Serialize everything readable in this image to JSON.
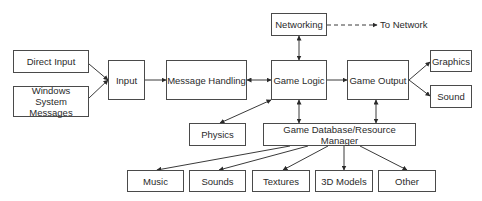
{
  "diagram": {
    "type": "flowchart",
    "nodes": [
      {
        "id": "direct_input",
        "label": "Direct Input",
        "x": 13,
        "y": 50,
        "w": 76,
        "h": 23
      },
      {
        "id": "windows_msgs",
        "label": "Windows System Messages",
        "x": 13,
        "y": 86,
        "w": 76,
        "h": 31
      },
      {
        "id": "input",
        "label": "Input",
        "x": 108,
        "y": 60,
        "w": 37,
        "h": 40
      },
      {
        "id": "message_handling",
        "label": "Message Handling",
        "x": 166,
        "y": 60,
        "w": 81,
        "h": 40
      },
      {
        "id": "networking",
        "label": "Networking",
        "x": 271,
        "y": 13,
        "w": 56,
        "h": 23
      },
      {
        "id": "game_logic",
        "label": "Game Logic",
        "x": 271,
        "y": 60,
        "w": 56,
        "h": 40
      },
      {
        "id": "game_output",
        "label": "Game Output",
        "x": 347,
        "y": 60,
        "w": 62,
        "h": 40
      },
      {
        "id": "graphics",
        "label": "Graphics",
        "x": 430,
        "y": 50,
        "w": 42,
        "h": 22
      },
      {
        "id": "sound",
        "label": "Sound",
        "x": 430,
        "y": 85,
        "w": 42,
        "h": 23
      },
      {
        "id": "physics",
        "label": "Physics",
        "x": 189,
        "y": 123,
        "w": 57,
        "h": 23
      },
      {
        "id": "game_db",
        "label": "Game Database/Resource Manager",
        "x": 263,
        "y": 123,
        "w": 153,
        "h": 23
      },
      {
        "id": "music",
        "label": "Music",
        "x": 127,
        "y": 170,
        "w": 57,
        "h": 22
      },
      {
        "id": "sounds",
        "label": "Sounds",
        "x": 189,
        "y": 170,
        "w": 57,
        "h": 22
      },
      {
        "id": "textures",
        "label": "Textures",
        "x": 252,
        "y": 170,
        "w": 58,
        "h": 22
      },
      {
        "id": "models_3d",
        "label": "3D Models",
        "x": 315,
        "y": 170,
        "w": 58,
        "h": 22
      },
      {
        "id": "other",
        "label": "Other",
        "x": 378,
        "y": 170,
        "w": 58,
        "h": 22
      }
    ],
    "external_label": {
      "text": "To Network",
      "x": 380,
      "y": 19
    },
    "edges": [
      {
        "from": "direct_input",
        "to": "input",
        "x1": 89,
        "y1": 64,
        "x2": 108,
        "y2": 80,
        "start": false,
        "end": true,
        "dashed": false
      },
      {
        "from": "windows_msgs",
        "to": "input",
        "x1": 89,
        "y1": 98,
        "x2": 108,
        "y2": 80,
        "start": false,
        "end": true,
        "dashed": false
      },
      {
        "from": "input",
        "to": "message_handling",
        "x1": 145,
        "y1": 80,
        "x2": 166,
        "y2": 80,
        "start": false,
        "end": true,
        "dashed": false
      },
      {
        "from": "message_handling",
        "to": "game_logic",
        "x1": 247,
        "y1": 80,
        "x2": 271,
        "y2": 80,
        "start": true,
        "end": true,
        "dashed": false
      },
      {
        "from": "networking",
        "to": "game_logic",
        "x1": 299,
        "y1": 36,
        "x2": 299,
        "y2": 60,
        "start": true,
        "end": true,
        "dashed": false
      },
      {
        "from": "networking",
        "to": "To Network",
        "x1": 327,
        "y1": 25,
        "x2": 377,
        "y2": 25,
        "start": false,
        "end": true,
        "dashed": true
      },
      {
        "from": "game_logic",
        "to": "game_output",
        "x1": 327,
        "y1": 80,
        "x2": 347,
        "y2": 80,
        "start": false,
        "end": true,
        "dashed": false
      },
      {
        "from": "game_output",
        "to": "graphics",
        "x1": 409,
        "y1": 80,
        "x2": 430,
        "y2": 62,
        "start": false,
        "end": true,
        "dashed": false
      },
      {
        "from": "game_output",
        "to": "sound",
        "x1": 409,
        "y1": 80,
        "x2": 430,
        "y2": 96,
        "start": false,
        "end": true,
        "dashed": false
      },
      {
        "from": "game_logic",
        "to": "physics",
        "x1": 271,
        "y1": 100,
        "x2": 220,
        "y2": 123,
        "start": true,
        "end": true,
        "dashed": false
      },
      {
        "from": "game_logic",
        "to": "game_db",
        "x1": 299,
        "y1": 100,
        "x2": 299,
        "y2": 123,
        "start": true,
        "end": true,
        "dashed": false
      },
      {
        "from": "game_output",
        "to": "game_db",
        "x1": 376,
        "y1": 100,
        "x2": 376,
        "y2": 123,
        "start": true,
        "end": true,
        "dashed": false
      },
      {
        "from": "game_db",
        "to": "music",
        "x1": 290,
        "y1": 146,
        "x2": 157,
        "y2": 170,
        "start": false,
        "end": true,
        "dashed": false
      },
      {
        "from": "game_db",
        "to": "sounds",
        "x1": 308,
        "y1": 146,
        "x2": 219,
        "y2": 170,
        "start": false,
        "end": true,
        "dashed": false
      },
      {
        "from": "game_db",
        "to": "textures",
        "x1": 328,
        "y1": 146,
        "x2": 283,
        "y2": 170,
        "start": false,
        "end": true,
        "dashed": false
      },
      {
        "from": "game_db",
        "to": "models_3d",
        "x1": 344,
        "y1": 146,
        "x2": 344,
        "y2": 170,
        "start": false,
        "end": true,
        "dashed": false
      },
      {
        "from": "game_db",
        "to": "other",
        "x1": 360,
        "y1": 146,
        "x2": 407,
        "y2": 170,
        "start": false,
        "end": true,
        "dashed": false
      }
    ],
    "colors": {
      "line": "#3a3a3a",
      "border": "#4a4a4a",
      "text": "#2a2a2a",
      "background": "#ffffff"
    }
  }
}
